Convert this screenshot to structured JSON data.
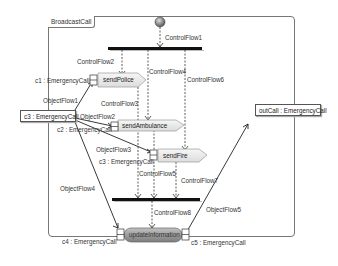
{
  "diagram": {
    "title": "BroadcastCall",
    "actions": {
      "send_police": "sendPolice",
      "send_ambulance": "sendAmbulance",
      "send_fire": "sendFire",
      "update_information": "updateInformation"
    },
    "pins": {
      "c1": "c1 : EmergencyCall",
      "c2": "c2 : EmergencyCall",
      "c3_pin": "c3 : EmergencyCall",
      "c4": "c4 : EmergencyCall",
      "c5": "c5 : EmergencyCall"
    },
    "object_nodes": {
      "c3_input": "c3 : EmergencyCall",
      "out_call": "outCall : EmergencyCall"
    },
    "control_flows": {
      "cf1": "ControlFlow1",
      "cf2": "ControlFlow2",
      "cf3": "ControlFlow3",
      "cf4": "ControlFlow4",
      "cf5": "ControlFlow5",
      "cf6": "ControlFlow6",
      "cf7": "ControlFlow7",
      "cf8": "ControlFlow8"
    },
    "object_flows": {
      "of1": "ObjectFlow1",
      "of2": "ObjectFlow2",
      "of3": "ObjectFlow3",
      "of4": "ObjectFlow4",
      "of5": "ObjectFlow5"
    },
    "colors": {
      "action_fill": "#ececec",
      "action_stroke": "#999999",
      "update_fill": "#9a9a9a",
      "bar": "#111111",
      "initial_node": "#777777"
    }
  }
}
